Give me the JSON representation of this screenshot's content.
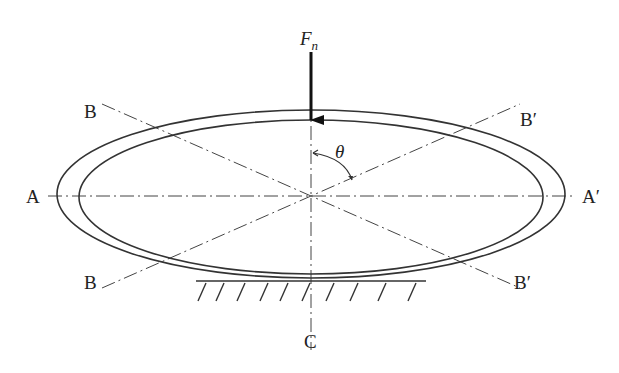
{
  "diagram": {
    "force": {
      "label": "F",
      "subscript": "n"
    },
    "angle": {
      "label": "θ"
    },
    "axes": {
      "A_left": "A",
      "A_right": "A′",
      "B_top_left": "B",
      "B_top_right": "B′",
      "B_bottom_left": "B",
      "B_bottom_right": "B′",
      "C_bottom": "C"
    },
    "colors": {
      "line": "#333333",
      "background": "#ffffff"
    }
  }
}
